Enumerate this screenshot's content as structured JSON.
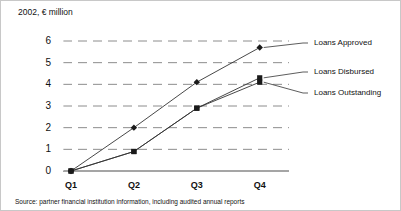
{
  "chart_data": {
    "type": "line",
    "title": "2002, € million",
    "xlabel": "",
    "ylabel": "",
    "categories": [
      "Q1",
      "Q2",
      "Q3",
      "Q4"
    ],
    "ylim": [
      0,
      6
    ],
    "yticks": [
      0,
      1,
      2,
      3,
      4,
      5,
      6
    ],
    "ytick_labels": [
      "0",
      "1",
      "2",
      "3",
      "4",
      "5",
      "6"
    ],
    "grid": true,
    "grid_style": "dashed-horizontal",
    "legend_position": "right-outside-leader-lines",
    "series": [
      {
        "name": "Loans Approved",
        "marker": "diamond",
        "values": [
          0.0,
          2.0,
          4.1,
          5.7
        ]
      },
      {
        "name": "Loans Disbursed",
        "marker": "square",
        "values": [
          0.0,
          0.9,
          2.9,
          4.3
        ]
      },
      {
        "name": "Loans Outstanding",
        "marker": "square",
        "values": [
          0.0,
          0.9,
          2.9,
          4.1
        ]
      }
    ],
    "source_note": "Source: partner financial institution information, including audited annual reports"
  },
  "legend": {
    "items": [
      {
        "label": "Loans Approved"
      },
      {
        "label": "Loans Disbursed"
      },
      {
        "label": "Loans Outstanding"
      }
    ]
  }
}
